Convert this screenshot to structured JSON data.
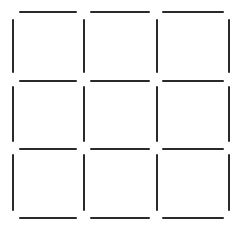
{
  "diagram": {
    "type": "matchstick-grid",
    "rows": 3,
    "cols": 3,
    "stick_color": "#2a2a2a",
    "background": "#ffffff",
    "stick_count": 24,
    "horizontal_y": [
      12,
      81,
      149,
      218
    ],
    "horizontal_spans": [
      [
        19,
        77
      ],
      [
        90,
        150
      ],
      [
        162,
        224
      ]
    ],
    "vertical_x": [
      13,
      84,
      157,
      229
    ],
    "vertical_spans": [
      [
        19,
        73
      ],
      [
        86,
        142
      ],
      [
        154,
        211
      ]
    ]
  }
}
